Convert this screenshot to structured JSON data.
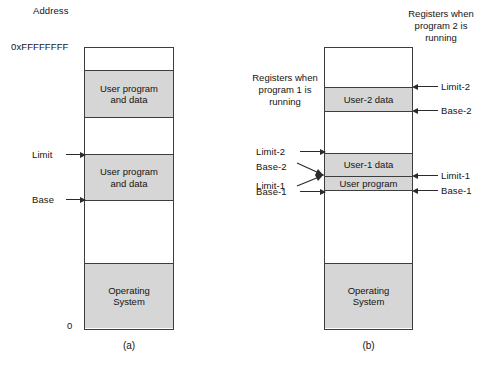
{
  "figure": {
    "top_axis_label": "Address",
    "panel_a": {
      "caption": "(a)",
      "top_address": "0xFFFFFFFF",
      "bottom_address": "0",
      "segments": [
        {
          "label": "",
          "fill": "empty"
        },
        {
          "label": "User program\nand data",
          "fill": "filled"
        },
        {
          "label": "",
          "fill": "empty"
        },
        {
          "label": "User program\nand data",
          "fill": "filled"
        },
        {
          "label": "",
          "fill": "empty"
        },
        {
          "label": "Operating\nSystem",
          "fill": "filled"
        }
      ],
      "markers": [
        {
          "name": "limit",
          "label": "Limit"
        },
        {
          "name": "base",
          "label": "Base"
        }
      ]
    },
    "panel_b": {
      "caption": "(b)",
      "segments": [
        {
          "label": "",
          "fill": "empty"
        },
        {
          "label": "User-2 data",
          "fill": "filled"
        },
        {
          "label": "",
          "fill": "empty"
        },
        {
          "label": "User-1 data",
          "fill": "filled"
        },
        {
          "label": "User program",
          "fill": "filled"
        },
        {
          "label": "",
          "fill": "empty"
        },
        {
          "label": "Operating\nSystem",
          "fill": "filled"
        }
      ],
      "left_note": "Registers\nwhen\nprogram 1\nis running",
      "right_note": "Registers\nwhen\nprogram 2\nis running",
      "left_markers": [
        {
          "name": "limit-2",
          "label": "Limit-2"
        },
        {
          "name": "base-2",
          "label": "Base-2"
        },
        {
          "name": "limit-1",
          "label": "Limit-1"
        },
        {
          "name": "base-1",
          "label": "Base-1"
        }
      ],
      "right_markers": [
        {
          "name": "limit-2",
          "label": "Limit-2"
        },
        {
          "name": "base-2",
          "label": "Base-2"
        },
        {
          "name": "limit-1",
          "label": "Limit-1"
        },
        {
          "name": "base-1",
          "label": "Base-1"
        }
      ]
    }
  },
  "colors": {
    "fill_gray": "#d6d6d6",
    "stroke": "#3d3d3d",
    "text": "#141414"
  }
}
